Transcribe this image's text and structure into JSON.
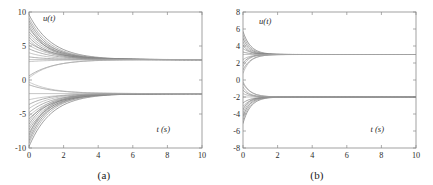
{
  "figure": {
    "caption_a": "(a)",
    "caption_b": "(b)"
  },
  "chart_data": [
    {
      "panel": "a",
      "type": "line",
      "title": "",
      "subtitle": "",
      "caption": "(a)",
      "xlabel": "t (s)",
      "ylabel": "u(t)",
      "xlim": [
        0,
        10
      ],
      "ylim": [
        -10,
        10
      ],
      "xticks": [
        0,
        2,
        4,
        6,
        8,
        10
      ],
      "xticklabels": [
        "0",
        "2",
        "4",
        "6",
        "8",
        "10"
      ],
      "yticks": [
        -10,
        -5,
        0,
        5,
        10
      ],
      "yticklabels": [
        "-10",
        "-5",
        "0",
        "5",
        "10"
      ],
      "grid": false,
      "legend": "none",
      "line_color": "#8c8c8c",
      "description": "Many state trajectories fanning out from spread initial conditions and converging asymptotically to two consensus levels near +3 and -2 by about t = 5 s.",
      "settling_time_s": 5,
      "consensus_levels": [
        3,
        -2
      ],
      "series": [
        {
          "name": "upper-cluster",
          "initial_values": [
            9.6,
            9.1,
            8.7,
            8.3,
            7.9,
            7.5,
            7.1,
            6.7,
            6.3,
            5.9,
            5.5,
            5.1,
            4.6,
            4.0,
            3.4,
            2.7,
            0.6,
            0.3
          ],
          "limit": 3
        },
        {
          "name": "lower-cluster",
          "initial_values": [
            -9.8,
            -9.3,
            -8.9,
            -8.5,
            -8.1,
            -7.7,
            -7.3,
            -6.9,
            -6.5,
            -6.1,
            -5.7,
            -5.3,
            -4.8,
            -4.2,
            -3.6,
            -2.9,
            -0.7,
            -0.3
          ],
          "limit": -2
        }
      ]
    },
    {
      "panel": "b",
      "type": "line",
      "title": "",
      "subtitle": "",
      "caption": "(b)",
      "xlabel": "t (s)",
      "ylabel": "u(t)",
      "xlim": [
        0,
        10
      ],
      "ylim": [
        -8,
        8
      ],
      "xticks": [
        0,
        2,
        4,
        6,
        8,
        10
      ],
      "xticklabels": [
        "0",
        "2",
        "4",
        "6",
        "8",
        "10"
      ],
      "yticks": [
        -8,
        -6,
        -4,
        -2,
        0,
        2,
        4,
        6,
        8
      ],
      "yticklabels": [
        "-8",
        "-6",
        "-4",
        "-2",
        "0",
        "2",
        "4",
        "6",
        "8"
      ],
      "grid": false,
      "legend": "none",
      "line_color": "#8c8c8c",
      "description": "State trajectories starting from a narrower band of initial conditions converging much faster to the same two consensus levels near +3 and -2, settled by about t = 1.5 s.",
      "settling_time_s": 1.5,
      "consensus_levels": [
        3,
        -2
      ],
      "series": [
        {
          "name": "upper-cluster",
          "initial_values": [
            5.7,
            5.3,
            4.9,
            4.5,
            4.1,
            3.7,
            3.3,
            2.4,
            2.0,
            1.6,
            1.2,
            0.8
          ],
          "limit": 3
        },
        {
          "name": "lower-cluster",
          "initial_values": [
            -5.1,
            -4.7,
            -4.3,
            -3.9,
            -3.5,
            -3.1,
            -2.7,
            -1.6,
            -1.2,
            -0.8,
            -0.4,
            -0.2
          ],
          "limit": -2
        }
      ]
    }
  ]
}
